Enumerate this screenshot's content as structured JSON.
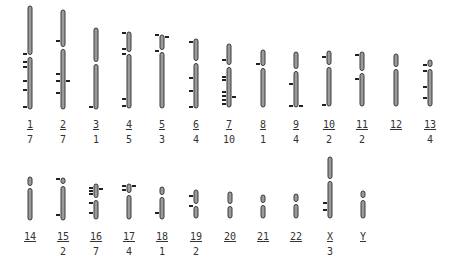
{
  "colors": {
    "chromosome": "#3a3a3a",
    "chromosome_highlight": "#9a9a9a",
    "marker": "#222222",
    "text": "#333333",
    "background": "#ffffff"
  },
  "chromosomes": [
    {
      "id": "1",
      "label": "1",
      "count": "7",
      "x": 30,
      "top": 6,
      "cen": 56,
      "bottom": 109,
      "row": 1,
      "left_marks": [
        54,
        62,
        67,
        81,
        90,
        107
      ],
      "right_marks": []
    },
    {
      "id": "2",
      "label": "2",
      "count": "7",
      "x": 63,
      "top": 10,
      "cen": 48,
      "bottom": 109,
      "row": 1,
      "left_marks": [
        41,
        74,
        81,
        93
      ],
      "right_marks": [
        81
      ]
    },
    {
      "id": "3",
      "label": "3",
      "count": "1",
      "x": 96,
      "top": 28,
      "cen": 63,
      "bottom": 109,
      "row": 1,
      "left_marks": [
        107
      ],
      "right_marks": []
    },
    {
      "id": "4",
      "label": "4",
      "count": "5",
      "x": 129,
      "top": 32,
      "cen": 53,
      "bottom": 108,
      "row": 1,
      "left_marks": [
        33,
        49,
        54,
        99,
        106
      ],
      "right_marks": []
    },
    {
      "id": "5",
      "label": "5",
      "count": "3",
      "x": 162,
      "top": 35,
      "cen": 51,
      "bottom": 108,
      "row": 1,
      "left_marks": [
        35,
        51
      ],
      "right_marks": [
        37
      ]
    },
    {
      "id": "6",
      "label": "6",
      "count": "4",
      "x": 196,
      "top": 39,
      "cen": 62,
      "bottom": 108,
      "row": 1,
      "left_marks": [
        42,
        78,
        91,
        107
      ],
      "right_marks": []
    },
    {
      "id": "7",
      "label": "7",
      "count": "10",
      "x": 229,
      "top": 44,
      "cen": 66,
      "bottom": 107,
      "row": 1,
      "left_marks": [
        60,
        77,
        80,
        92,
        96,
        100,
        104
      ],
      "right_marks": [
        97
      ]
    },
    {
      "id": "8",
      "label": "8",
      "count": "1",
      "x": 263,
      "top": 50,
      "cen": 67,
      "bottom": 107,
      "row": 1,
      "left_marks": [
        64
      ],
      "right_marks": []
    },
    {
      "id": "9",
      "label": "9",
      "count": "4",
      "x": 296,
      "top": 52,
      "cen": 70,
      "bottom": 107,
      "row": 1,
      "left_marks": [
        84,
        106
      ],
      "right_marks": [
        106
      ]
    },
    {
      "id": "10",
      "label": "10",
      "count": "2",
      "x": 329,
      "top": 51,
      "cen": 66,
      "bottom": 106,
      "row": 1,
      "left_marks": [
        57,
        105
      ],
      "right_marks": []
    },
    {
      "id": "11",
      "label": "11",
      "count": "2",
      "x": 362,
      "top": 52,
      "cen": 72,
      "bottom": 106,
      "row": 1,
      "left_marks": [
        55,
        79
      ],
      "right_marks": []
    },
    {
      "id": "12",
      "label": "12",
      "count": "",
      "x": 396,
      "top": 54,
      "cen": 68,
      "bottom": 106,
      "row": 1,
      "left_marks": [],
      "right_marks": []
    },
    {
      "id": "13",
      "label": "13",
      "count": "4",
      "x": 430,
      "top": 60,
      "cen": 68,
      "bottom": 106,
      "row": 1,
      "left_marks": [
        65,
        71,
        87,
        98
      ],
      "right_marks": []
    },
    {
      "id": "14",
      "label": "14",
      "count": "",
      "x": 30,
      "top": 177,
      "cen": 187,
      "bottom": 220,
      "row": 2,
      "left_marks": [],
      "right_marks": []
    },
    {
      "id": "15",
      "label": "15",
      "count": "2",
      "x": 63,
      "top": 178,
      "cen": 185,
      "bottom": 220,
      "row": 2,
      "left_marks": [
        179,
        215
      ],
      "right_marks": []
    },
    {
      "id": "16",
      "label": "16",
      "count": "7",
      "x": 96,
      "top": 184,
      "cen": 199,
      "bottom": 219,
      "row": 2,
      "left_marks": [
        188,
        191,
        194,
        203,
        213
      ],
      "right_marks": [
        189
      ]
    },
    {
      "id": "17",
      "label": "17",
      "count": "4",
      "x": 129,
      "top": 184,
      "cen": 194,
      "bottom": 219,
      "row": 2,
      "left_marks": [
        186,
        190
      ],
      "right_marks": [
        186
      ]
    },
    {
      "id": "18",
      "label": "18",
      "count": "1",
      "x": 162,
      "top": 187,
      "cen": 196,
      "bottom": 219,
      "row": 2,
      "left_marks": [
        213
      ],
      "right_marks": []
    },
    {
      "id": "19",
      "label": "19",
      "count": "2",
      "x": 196,
      "top": 190,
      "cen": 205,
      "bottom": 218,
      "row": 2,
      "left_marks": [
        196,
        206
      ],
      "right_marks": []
    },
    {
      "id": "20",
      "label": "20",
      "count": "",
      "x": 230,
      "top": 192,
      "cen": 205,
      "bottom": 218,
      "row": 2,
      "left_marks": [],
      "right_marks": []
    },
    {
      "id": "21",
      "label": "21",
      "count": "",
      "x": 263,
      "top": 195,
      "cen": 204,
      "bottom": 218,
      "row": 2,
      "left_marks": [],
      "right_marks": []
    },
    {
      "id": "22",
      "label": "22",
      "count": "",
      "x": 296,
      "top": 194,
      "cen": 203,
      "bottom": 218,
      "row": 2,
      "left_marks": [],
      "right_marks": []
    },
    {
      "id": "X",
      "label": "X",
      "count": "3",
      "x": 330,
      "top": 157,
      "cen": 180,
      "bottom": 218,
      "row": 2,
      "left_marks": [
        203,
        210
      ],
      "right_marks": []
    },
    {
      "id": "Y",
      "label": "Y",
      "count": "",
      "x": 363,
      "top": 191,
      "cen": 199,
      "bottom": 218,
      "row": 2,
      "left_marks": [],
      "right_marks": []
    }
  ],
  "rows": {
    "1": {
      "label_y": 119,
      "count_y": 134
    },
    "2": {
      "label_y": 231,
      "count_y": 246
    }
  }
}
